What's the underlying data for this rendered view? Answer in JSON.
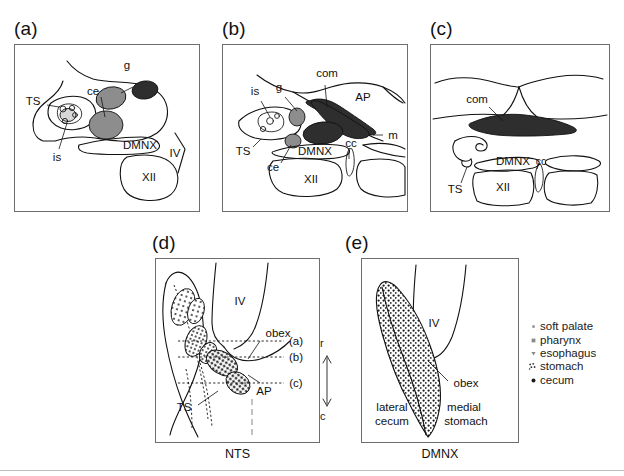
{
  "figure": {
    "panels": [
      {
        "id": "a",
        "label": "(a)",
        "labels": [
          "g",
          "ce",
          "TS",
          "is",
          "DMNX",
          "IV",
          "XII"
        ],
        "caption": ""
      },
      {
        "id": "b",
        "label": "(b)",
        "labels": [
          "com",
          "AP",
          "g",
          "is",
          "m",
          "TS",
          "ce",
          "DMNX",
          "cc",
          "XII"
        ],
        "caption": ""
      },
      {
        "id": "c",
        "label": "(c)",
        "labels": [
          "com",
          "TS",
          "DMNX",
          "cc",
          "XII"
        ],
        "caption": ""
      },
      {
        "id": "d",
        "label": "(d)",
        "labels": [
          "IV",
          "obex",
          "(a)",
          "(b)",
          "(c)",
          "AP",
          "TS",
          "r",
          "c"
        ],
        "caption": "NTS"
      },
      {
        "id": "e",
        "label": "(e)",
        "labels": [
          "IV",
          "obex",
          "lateral",
          "cecum",
          "medial",
          "stomach"
        ],
        "caption": "DMNX"
      }
    ],
    "panel_a": {
      "label": "(a)",
      "g": "g",
      "ce": "ce",
      "ts": "TS",
      "is": "is",
      "dmnx": "DMNX",
      "iv": "IV",
      "xii": "XII"
    },
    "panel_b": {
      "label": "(b)",
      "com": "com",
      "ap": "AP",
      "g": "g",
      "is": "is",
      "m": "m",
      "ts": "TS",
      "ce": "ce",
      "dmnx": "DMNX",
      "cc": "cc",
      "xii": "XII"
    },
    "panel_c": {
      "label": "(c)",
      "com": "com",
      "ts": "TS",
      "dmnx": "DMNX",
      "cc": "cc",
      "xii": "XII"
    },
    "panel_d": {
      "label": "(d)",
      "iv": "IV",
      "obex": "obex",
      "level_a": "(a)",
      "level_b": "(b)",
      "level_c": "(c)",
      "ap": "AP",
      "ts": "TS",
      "rostral": "r",
      "caudal": "c",
      "caption": "NTS"
    },
    "panel_e": {
      "label": "(e)",
      "iv": "IV",
      "obex": "obex",
      "lateral": "lateral",
      "cecum": "cecum",
      "medial": "medial",
      "stomach": "stomach",
      "caption": "DMNX"
    },
    "legend": {
      "items": [
        {
          "marker": "small-dot-marker",
          "label": "soft palate"
        },
        {
          "marker": "small-square-marker",
          "label": "pharynx"
        },
        {
          "marker": "triangle-down-marker",
          "label": "esophagus"
        },
        {
          "marker": "stipple-cluster-marker",
          "label": "stomach"
        },
        {
          "marker": "filled-dot-marker",
          "label": "cecum"
        }
      ]
    },
    "colors": {
      "panel_border": "#6e6e6e",
      "outline": "#111111",
      "blob_mid_gray": "#8d8d8d",
      "blob_dark": "#2e2e2e",
      "blob_light": "#d8d8d8",
      "background": "#ffffff"
    }
  }
}
